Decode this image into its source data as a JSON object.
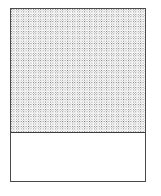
{
  "figure": {
    "type": "filled-container-diagram",
    "title": "",
    "caption": "",
    "background_color": "#ffffff"
  },
  "container": {
    "label": "",
    "border_color": "#4a4a4a",
    "border_width_px": 1.2,
    "fill_color": "#ffffff",
    "x_px": 10,
    "y_px": 8,
    "width_px": 136,
    "height_px": 174
  },
  "fill_region": {
    "label": "",
    "pattern": "stipple-checker-dots",
    "pattern_dot_color": "#6f6f6f",
    "pattern_light_dot_color": "#bdbdbd",
    "pattern_background_color": "#ffffff",
    "pattern_pitch_px": 2.45,
    "height_px": 123
  },
  "level_line": {
    "label": "",
    "color": "#3d3d3d",
    "width_px": 1.3,
    "y_offset_px": 123
  },
  "empty_region": {
    "label": "",
    "fill_color": "#ffffff",
    "height_px": 49.7
  },
  "chart_data": {
    "type": "bar",
    "title": "",
    "xlabel": "",
    "ylabel": "",
    "categories": [
      "container"
    ],
    "series": [
      {
        "name": "filled",
        "values": [
          70.7
        ]
      },
      {
        "name": "empty",
        "values": [
          29.3
        ]
      }
    ],
    "values": [
      70.7
    ],
    "ylim": [
      0,
      100
    ],
    "grid": false,
    "legend": "none",
    "annotations": []
  }
}
